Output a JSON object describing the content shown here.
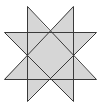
{
  "diagram": {
    "type": "eight-pointed-star",
    "width": 108,
    "height": 103,
    "colors": {
      "background": "#ffffff",
      "fill": "#d6d6d6",
      "stroke": "#3a3a3a"
    },
    "stroke_width": 1,
    "outline_points": [
      [
        27,
        6
      ],
      [
        50,
        32
      ],
      [
        73,
        6
      ],
      [
        73,
        32
      ],
      [
        96,
        32
      ],
      [
        73,
        56
      ],
      [
        96,
        79
      ],
      [
        73,
        79
      ],
      [
        73,
        101
      ],
      [
        50,
        79
      ],
      [
        27,
        101
      ],
      [
        27,
        79
      ],
      [
        4,
        79
      ],
      [
        27,
        56
      ],
      [
        4,
        32
      ],
      [
        27,
        32
      ]
    ],
    "lines": [
      {
        "name": "horizontal-top-line",
        "x1": 4,
        "y1": 32,
        "x2": 96,
        "y2": 32
      },
      {
        "name": "horizontal-bottom-line",
        "x1": 4,
        "y1": 79,
        "x2": 96,
        "y2": 79
      },
      {
        "name": "vertical-left-line",
        "x1": 27,
        "y1": 6,
        "x2": 27,
        "y2": 101
      },
      {
        "name": "vertical-right-line",
        "x1": 73,
        "y1": 6,
        "x2": 73,
        "y2": 101
      },
      {
        "name": "diagonal-topleft-to-bottomright",
        "x1": 27,
        "y1": 6,
        "x2": 96,
        "y2": 79
      },
      {
        "name": "diagonal-topright-to-bottomleft",
        "x1": 73,
        "y1": 6,
        "x2": 4,
        "y2": 79
      },
      {
        "name": "diagonal-left-to-bottomright",
        "x1": 4,
        "y1": 32,
        "x2": 73,
        "y2": 101
      },
      {
        "name": "diagonal-right-to-bottomleft",
        "x1": 96,
        "y1": 32,
        "x2": 27,
        "y2": 101
      }
    ]
  }
}
